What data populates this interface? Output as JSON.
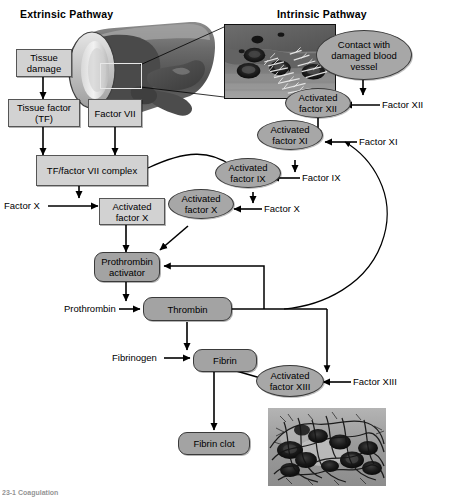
{
  "figure": {
    "titles": {
      "extrinsic": "Extrinsic Pathway",
      "intrinsic": "Intrinsic Pathway"
    },
    "caption": "23-1  Coagulation",
    "colors": {
      "box_fill": "#d2d2d2",
      "ellipse_fill": "#a7a7a7",
      "rounded_fill": "#a3a3a3",
      "stroke": "#3a3a3a",
      "background": "#ffffff"
    }
  },
  "nodes": {
    "tissue_damage": {
      "label": "Tissue damage",
      "shape": "box"
    },
    "tissue_factor": {
      "label": "Tissue factor (TF)",
      "shape": "box"
    },
    "factor_vii": {
      "label": "Factor VII",
      "shape": "box"
    },
    "tf_factor_vii_complex": {
      "label": "TF/factor VII complex",
      "shape": "box"
    },
    "activated_factor_x_box": {
      "label": "Activated factor X",
      "shape": "box"
    },
    "contact_damaged_vessel": {
      "label": "Contact with damaged blood vessel",
      "shape": "ellipse"
    },
    "activated_factor_xii": {
      "label": "Activated factor XII",
      "shape": "ellipse"
    },
    "activated_factor_xi": {
      "label": "Activated factor XI",
      "shape": "ellipse"
    },
    "activated_factor_ix": {
      "label": "Activated factor IX",
      "shape": "ellipse"
    },
    "activated_factor_x_ell": {
      "label": "Activated factor X",
      "shape": "ellipse"
    },
    "activated_factor_xiii": {
      "label": "Activated factor XIII",
      "shape": "ellipse"
    },
    "prothrombin_activator": {
      "label": "Prothrombin activator",
      "shape": "rounded"
    },
    "thrombin": {
      "label": "Thrombin",
      "shape": "rounded"
    },
    "fibrin": {
      "label": "Fibrin",
      "shape": "rounded"
    },
    "fibrin_clot": {
      "label": "Fibrin clot",
      "shape": "rounded"
    }
  },
  "inputs": {
    "factor_x_left": "Factor X",
    "factor_x_right": "Factor X",
    "factor_ix": "Factor IX",
    "factor_xi": "Factor XI",
    "factor_xii": "Factor XII",
    "factor_xiii": "Factor XIII",
    "prothrombin": "Prothrombin",
    "fibrinogen": "Fibrinogen"
  },
  "images": {
    "vessel_illustration": "damaged-blood-vessel-illustration",
    "inset_vessel_micrograph": "damaged-vessel-collagen-micrograph",
    "inset_clot_micrograph": "fibrin-clot-micrograph"
  }
}
